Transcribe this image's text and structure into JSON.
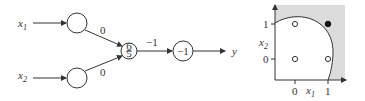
{
  "network": {
    "inputs": [
      {
        "label": "x",
        "sub": "1"
      },
      {
        "label": "x",
        "sub": "2"
      }
    ],
    "weights": {
      "w1": "0",
      "w2": "0",
      "w_out": "−1"
    },
    "hidden_node": {
      "num": "6",
      "den": "5"
    },
    "output_node": {
      "value": "−1"
    },
    "output_label": "y"
  },
  "plot": {
    "xlabel": {
      "label": "x",
      "sub": "1"
    },
    "ylabel": {
      "label": "x",
      "sub": "2"
    },
    "xticks": [
      "0",
      "1"
    ],
    "yticks": [
      "0",
      "1"
    ],
    "points": [
      {
        "x": 0,
        "y": 1,
        "filled": false
      },
      {
        "x": 1,
        "y": 1,
        "filled": true
      },
      {
        "x": 0,
        "y": 0,
        "filled": false
      },
      {
        "x": 1,
        "y": 0,
        "filled": false
      }
    ],
    "colors": {
      "region": "#dcdcdc",
      "stroke": "#333333"
    }
  }
}
